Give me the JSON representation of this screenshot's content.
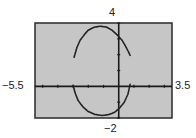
{
  "chart_data": {
    "type": "line",
    "title": "",
    "xlabel": "",
    "ylabel": "",
    "xlim": [
      -5.5,
      3.5
    ],
    "ylim": [
      -2,
      4
    ],
    "xscale": 1,
    "yscale": 1,
    "grid": false,
    "background": "#c6c6c6",
    "window_labels": {
      "xmin": "−5.5",
      "xmax": "3.5",
      "ymin": "−2",
      "ymax": "4"
    },
    "series": [
      {
        "name": "upper arc",
        "x": [
          -2.93,
          -2.75,
          -2.54,
          -2.25,
          -2.01,
          -1.6,
          -1.22,
          -0.8,
          -0.43,
          -0.1,
          0.22,
          0.5,
          0.75
        ],
        "y": [
          1.84,
          2.45,
          2.91,
          3.28,
          3.54,
          3.74,
          3.8,
          3.74,
          3.54,
          3.25,
          2.91,
          2.45,
          1.96
        ]
      },
      {
        "name": "lower arc",
        "x": [
          -3.0,
          -2.85,
          -2.67,
          -2.35,
          -2.01,
          -1.55,
          -1.09,
          -0.7,
          -0.3,
          0.05,
          0.36,
          0.6,
          0.75
        ],
        "y": [
          0.06,
          -0.45,
          -0.89,
          -1.3,
          -1.58,
          -1.78,
          -1.84,
          -1.79,
          -1.65,
          -1.38,
          -1.01,
          -0.5,
          0.13
        ]
      }
    ]
  }
}
